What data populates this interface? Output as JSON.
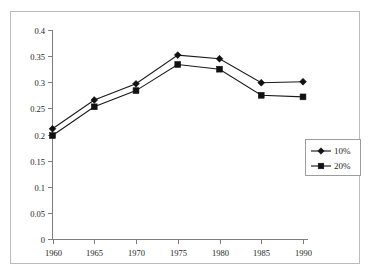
{
  "chart_data": {
    "type": "line",
    "title": "",
    "subtitle": "",
    "xlabel": "",
    "ylabel": "",
    "categories": [
      "1960",
      "1965",
      "1970",
      "1975",
      "1980",
      "1985",
      "1990"
    ],
    "x": [
      1960,
      1965,
      1970,
      1975,
      1980,
      1985,
      1990
    ],
    "xlim": [
      1960,
      1990
    ],
    "ylim": [
      0,
      0.4
    ],
    "ytick_labels": [
      "0",
      "0.05",
      "0.1",
      "0.15",
      "0.2",
      "0.25",
      "0.3",
      "0.35",
      "0.4"
    ],
    "ytick_values": [
      0,
      0.05,
      0.1,
      0.15,
      0.2,
      0.25,
      0.3,
      0.35,
      0.4
    ],
    "xtick_labels": [
      "1960",
      "1965",
      "1970",
      "1975",
      "1980",
      "1985",
      "1990"
    ],
    "grid": false,
    "legend_position": "right",
    "series": [
      {
        "name": "10%",
        "marker": "diamond",
        "color": "#111111",
        "values": [
          0.211,
          0.266,
          0.297,
          0.352,
          0.345,
          0.299,
          0.301
        ]
      },
      {
        "name": "20%",
        "marker": "square",
        "color": "#111111",
        "values": [
          0.198,
          0.253,
          0.284,
          0.334,
          0.325,
          0.275,
          0.272
        ]
      }
    ]
  },
  "legend": {
    "entries": [
      {
        "label": "10%",
        "marker": "diamond"
      },
      {
        "label": "20%",
        "marker": "square"
      }
    ]
  },
  "frame": {
    "border_color": "#b9bcc0",
    "background": "#ffffff",
    "axis_color": "#7b7f84",
    "line_color": "#111111"
  },
  "artifacts": {
    "top_partial_text": " "
  }
}
